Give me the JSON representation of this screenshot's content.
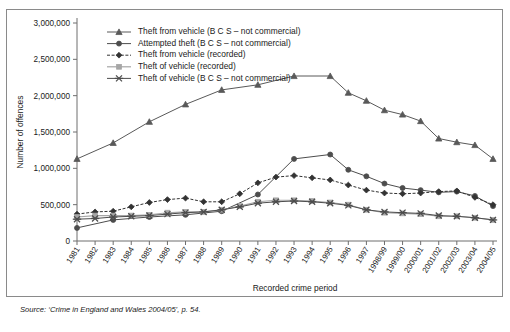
{
  "figure": {
    "source_note": "Source: ‘Crime in England and Wales 2004/05’, p. 54."
  },
  "chart_data": {
    "type": "line",
    "title": "",
    "xlabel": "Recorded crime period",
    "ylabel": "Number of offences",
    "ylim": [
      0,
      3000000
    ],
    "ytick_labels": [
      "0",
      "500,000",
      "1,000,000",
      "1,500,000",
      "2,000,000",
      "2,500,000",
      "3,000,000"
    ],
    "ytick_values": [
      0,
      500000,
      1000000,
      1500000,
      2000000,
      2500000,
      3000000
    ],
    "grid": false,
    "legend_position": "top-left-inside",
    "categories": [
      "1981",
      "1982",
      "1983",
      "1984",
      "1985",
      "1986",
      "1987",
      "1988",
      "1989",
      "1990",
      "1991",
      "1992",
      "1993",
      "1994",
      "1995",
      "1996",
      "1997",
      "1998/99",
      "1999/00",
      "2000/01",
      "2001/02",
      "2002/03",
      "2003/04",
      "2004/05"
    ],
    "series": [
      {
        "name": "Theft from vehicle (B C S – not commercial)",
        "marker": "triangle",
        "linestyle": "solid",
        "color": "#595959",
        "values": [
          1130000,
          null,
          1350000,
          null,
          1640000,
          null,
          1880000,
          null,
          2080000,
          null,
          2150000,
          null,
          2270000,
          null,
          2270000,
          2040000,
          1930000,
          1800000,
          1740000,
          1650000,
          1410000,
          1360000,
          1320000,
          1130000
        ]
      },
      {
        "name": "Attempted theft (B C S – not commercial)",
        "marker": "circle",
        "linestyle": "solid",
        "color": "#4d4d4d",
        "values": [
          180000,
          null,
          290000,
          null,
          330000,
          null,
          360000,
          null,
          410000,
          null,
          640000,
          null,
          1130000,
          null,
          1190000,
          980000,
          890000,
          790000,
          730000,
          700000,
          670000,
          680000,
          620000,
          480000
        ]
      },
      {
        "name": "Theft from vehicle (recorded)",
        "marker": "diamond",
        "linestyle": "dashed",
        "color": "#333333",
        "values": [
          370000,
          400000,
          410000,
          470000,
          530000,
          570000,
          590000,
          540000,
          540000,
          650000,
          800000,
          880000,
          900000,
          870000,
          840000,
          770000,
          700000,
          660000,
          650000,
          660000,
          680000,
          690000,
          600000,
          500000
        ]
      },
      {
        "name": "Theft of vehicle (recorded)",
        "marker": "square",
        "linestyle": "solid",
        "color": "#a6a6a6",
        "values": [
          330000,
          350000,
          350000,
          350000,
          360000,
          390000,
          400000,
          400000,
          430000,
          480000,
          540000,
          560000,
          560000,
          550000,
          530000,
          500000,
          430000,
          390000,
          380000,
          370000,
          340000,
          340000,
          320000,
          290000
        ]
      },
      {
        "name": "Theft of vehicle (B C S – not commercial)",
        "marker": "cross",
        "linestyle": "solid",
        "color": "#4d4d4d",
        "values": [
          300000,
          310000,
          330000,
          340000,
          350000,
          370000,
          390000,
          400000,
          430000,
          470000,
          520000,
          540000,
          550000,
          540000,
          520000,
          490000,
          430000,
          400000,
          390000,
          380000,
          350000,
          340000,
          320000,
          290000
        ]
      }
    ]
  }
}
